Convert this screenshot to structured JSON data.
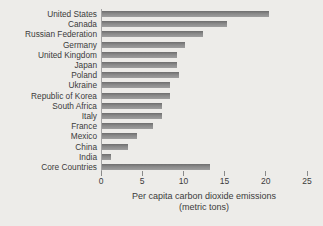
{
  "chart_data": {
    "type": "bar",
    "orientation": "horizontal",
    "title": "",
    "categories": [
      "United States",
      "Canada",
      "Russian Federation",
      "Germany",
      "United Kingdom",
      "Japan",
      "Poland",
      "Ukraine",
      "Republic of Korea",
      "South Africa",
      "Italy",
      "France",
      "Mexico",
      "China",
      "India",
      "Core Countries"
    ],
    "values": [
      20.3,
      15.2,
      12.2,
      10.1,
      9.1,
      9.1,
      9.3,
      8.2,
      8.2,
      7.3,
      7.3,
      6.2,
      4.2,
      3.2,
      1.1,
      13.1
    ],
    "xlabel": "Per capita carbon dioxide emissions",
    "xlabel_unit": "(metric tons)",
    "xlim": [
      0,
      25
    ],
    "xticks": [
      0,
      5,
      10,
      15,
      20,
      25
    ],
    "grid": false,
    "legend": false,
    "bar_color": "#8a8a8a",
    "background_color": "#edece9",
    "text_color": "#3b3b3b",
    "axis_color": "#a3a3a3"
  }
}
